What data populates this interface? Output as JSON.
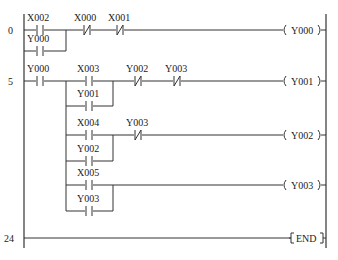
{
  "diagram": {
    "type": "ladder-logic",
    "rails": {
      "left_x": 24,
      "right_x": 326
    },
    "rungs": [
      {
        "step": "0",
        "y": 30,
        "elements": [
          {
            "type": "NO",
            "label": "X002",
            "x": 40,
            "y": 30
          },
          {
            "type": "NO",
            "label": "Y000",
            "x": 40,
            "y": 51,
            "branch": true
          },
          {
            "type": "NC",
            "label": "X000",
            "x": 87,
            "y": 30
          },
          {
            "type": "NC",
            "label": "X001",
            "x": 120,
            "y": 30
          }
        ],
        "coil": {
          "label": "Y000",
          "y": 30
        }
      },
      {
        "step": "5",
        "y": 81,
        "elements": [
          {
            "type": "NO",
            "label": "Y000",
            "x": 40,
            "y": 81
          },
          {
            "type": "NO",
            "label": "X003",
            "x": 89,
            "y": 81
          },
          {
            "type": "NO",
            "label": "Y001",
            "x": 89,
            "y": 106,
            "branch": true
          },
          {
            "type": "NC",
            "label": "Y002",
            "x": 138,
            "y": 81
          },
          {
            "type": "NC",
            "label": "Y003",
            "x": 177,
            "y": 81
          }
        ],
        "coil": {
          "label": "Y001",
          "y": 81
        }
      },
      {
        "step": "",
        "y": 135,
        "elements": [
          {
            "type": "NO",
            "label": "X004",
            "x": 89,
            "y": 135
          },
          {
            "type": "NO",
            "label": "Y002",
            "x": 89,
            "y": 161,
            "branch": true
          },
          {
            "type": "NC",
            "label": "Y003",
            "x": 138,
            "y": 135
          }
        ],
        "coil": {
          "label": "Y002",
          "y": 135
        }
      },
      {
        "step": "",
        "y": 185,
        "elements": [
          {
            "type": "NO",
            "label": "X005",
            "x": 89,
            "y": 185
          },
          {
            "type": "NO",
            "label": "Y003",
            "x": 89,
            "y": 211,
            "branch": true
          }
        ],
        "coil": {
          "label": "Y003",
          "y": 185
        }
      },
      {
        "step": "24",
        "y": 238,
        "elements": [],
        "coil": {
          "label": "END",
          "y": 238,
          "type": "instruction"
        }
      }
    ],
    "step_numbers": [
      "0",
      "5",
      "24"
    ],
    "labels": {
      "r0_c1": "X002",
      "r0_c2": "Y000",
      "r0_c3": "X000",
      "r0_c4": "X001",
      "r0_coil": "Y000",
      "r1_c1": "Y000",
      "r1_c2": "X003",
      "r1_c3": "Y001",
      "r1_c4": "Y002",
      "r1_c5": "Y003",
      "r1_coil": "Y001",
      "r2_c1": "X004",
      "r2_c2": "Y002",
      "r2_c3": "Y003",
      "r2_coil": "Y002",
      "r3_c1": "X005",
      "r3_c2": "Y003",
      "r3_coil": "Y003",
      "r4_coil": "END"
    }
  }
}
